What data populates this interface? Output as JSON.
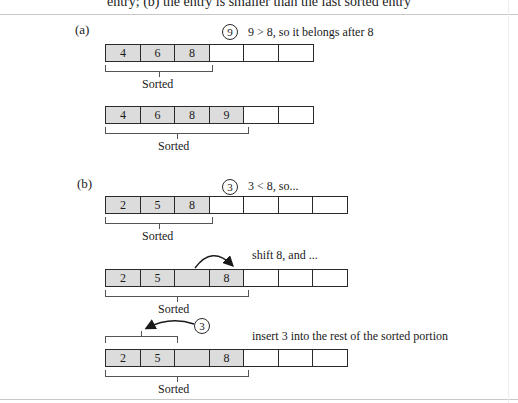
{
  "caption": "entry; (b) the entry is smaller than the last sorted entry",
  "part_a": {
    "label": "(a)",
    "step1": {
      "entry": "9",
      "note": "9 > 8, so it belongs after 8",
      "cells": [
        "4",
        "6",
        "8",
        "",
        "",
        ""
      ],
      "sorted_count": 3,
      "bracket_label": "Sorted"
    },
    "step2": {
      "cells": [
        "4",
        "6",
        "8",
        "9",
        "",
        ""
      ],
      "sorted_count": 4,
      "bracket_label": "Sorted"
    }
  },
  "part_b": {
    "label": "(b)",
    "step1": {
      "entry": "3",
      "note": "3 < 8, so...",
      "cells": [
        "2",
        "5",
        "8",
        "",
        "",
        "",
        ""
      ],
      "sorted_count": 3,
      "bracket_label": "Sorted"
    },
    "step2": {
      "note": "shift 8, and ...",
      "cells": [
        "2",
        "5",
        "",
        "8",
        "",
        "",
        ""
      ],
      "sorted_count": 4,
      "bracket_label": "Sorted"
    },
    "step3": {
      "entry": "3",
      "note": "insert 3 into the rest of the sorted portion",
      "cells": [
        "2",
        "5",
        "",
        "8",
        "",
        "",
        ""
      ],
      "sorted_count": 4,
      "bracket_label": "Sorted"
    }
  }
}
